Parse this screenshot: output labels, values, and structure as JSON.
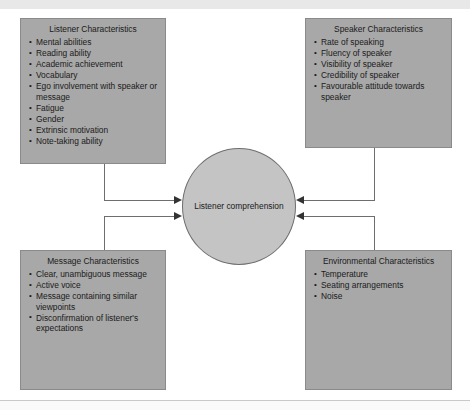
{
  "diagram": {
    "center": {
      "label": "Listener comprehension"
    },
    "boxes": [
      {
        "id": "listener",
        "title": "Listener Characteristics",
        "items": [
          "Mental abilities",
          "Reading ability",
          "Academic achievement",
          "Vocabulary",
          "Ego involvement with speaker or message",
          "Fatigue",
          "Gender",
          "Extrinsic motivation",
          "Note-taking ability"
        ]
      },
      {
        "id": "speaker",
        "title": "Speaker Characteristics",
        "items": [
          "Rate of speaking",
          "Fluency of speaker",
          "Visibility of speaker",
          "Credibility of speaker",
          "Favourable attitude towards speaker"
        ]
      },
      {
        "id": "message",
        "title": "Message Characteristics",
        "items": [
          "Clear, unambiguous message",
          "Active voice",
          "Message containing similar viewpoints",
          "Disconfirmation of listener's expectations"
        ]
      },
      {
        "id": "environment",
        "title": "Environmental Characteristics",
        "items": [
          "Temperature",
          "Seating arrangements",
          "Noise"
        ]
      }
    ],
    "colors": {
      "box_fill": "#a8a8a8",
      "box_border": "#8a8a8a",
      "center_fill": "#c4c4c4",
      "center_border": "#6e6e6e",
      "connector": "#6e6e6e",
      "arrowhead": "#333333",
      "text": "#1a1a1a",
      "page_background": "#ffffff"
    }
  }
}
